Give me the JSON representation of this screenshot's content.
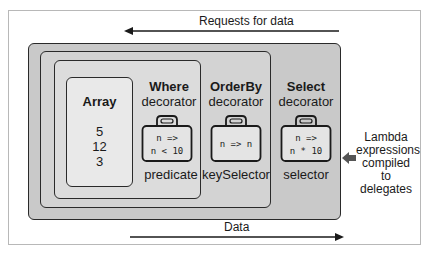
{
  "diagram": {
    "top_arrow": {
      "label": "Requests for data",
      "direction": "left"
    },
    "bottom_arrow": {
      "label": "Data",
      "direction": "right"
    },
    "side_note": {
      "lines": [
        "Lambda",
        "expressions",
        "compiled to",
        "delegates"
      ],
      "arrow_direction": "left"
    },
    "array": {
      "title": "Array",
      "values": [
        "5",
        "12",
        "3"
      ]
    },
    "decorators": [
      {
        "name": "Where",
        "subtitle": "decorator",
        "code_lines": [
          "n =>",
          "n < 10"
        ],
        "caption": "predicate"
      },
      {
        "name": "OrderBy",
        "subtitle": "decorator",
        "code_lines": [
          "n => n"
        ],
        "caption": "keySelector"
      },
      {
        "name": "Select",
        "subtitle": "decorator",
        "code_lines": [
          "n =>",
          "n * 10"
        ],
        "caption": "selector"
      }
    ],
    "colors": {
      "select_fill": "#c9c9c9",
      "orderby_fill": "#d3d3d3",
      "where_fill": "#dcdcdc",
      "array_fill": "#e9e9e9",
      "stroke": "#2a2a2a"
    }
  }
}
